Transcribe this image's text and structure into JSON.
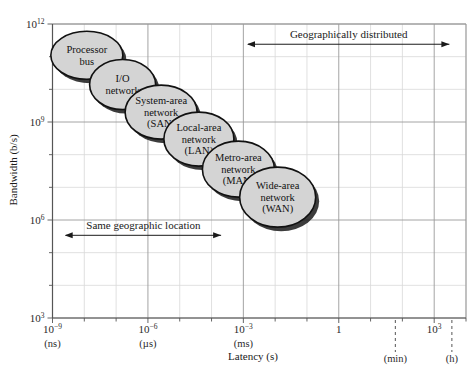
{
  "chart_data": {
    "type": "scatter",
    "title": "",
    "xlabel": "Latency (s)",
    "ylabel": "Bandwidth (b/s)",
    "xscale": "log",
    "yscale": "log",
    "xlim": [
      1e-09,
      10000.0
    ],
    "ylim": [
      1000,
      1000000000000.0
    ],
    "grid": true,
    "legend": "none",
    "x_ticks": [
      {
        "value": 1e-09,
        "mantissa": "10",
        "exponent": "−9",
        "unit": "(ns)"
      },
      {
        "value": 1e-06,
        "mantissa": "10",
        "exponent": "−6",
        "unit": "(µs)"
      },
      {
        "value": 0.001,
        "mantissa": "10",
        "exponent": "−3",
        "unit": "(ms)"
      },
      {
        "value": 1,
        "mantissa": "1",
        "exponent": "",
        "unit": ""
      },
      {
        "value": 1000,
        "mantissa": "10",
        "exponent": "3",
        "unit": ""
      }
    ],
    "x_marker_ticks": [
      {
        "label": "(min)",
        "value": 60
      },
      {
        "label": "(h)",
        "value": 3600
      }
    ],
    "y_ticks": [
      {
        "value": 1000000000000.0,
        "mantissa": "10",
        "exponent": "12"
      },
      {
        "value": 1000000000.0,
        "mantissa": "10",
        "exponent": "9"
      },
      {
        "value": 1000000.0,
        "mantissa": "10",
        "exponent": "6"
      },
      {
        "value": 1000,
        "mantissa": "10",
        "exponent": "3"
      }
    ],
    "points": [
      {
        "name": "Processor bus",
        "lines": [
          "Processor",
          "bus"
        ],
        "x": 1.2e-08,
        "y": 110000000000.0
      },
      {
        "name": "I/O network",
        "lines": [
          "I/O",
          "network"
        ],
        "x": 1.6e-07,
        "y": 14000000000.0
      },
      {
        "name": "System-area network (SAN)",
        "lines": [
          "System-area",
          "network",
          "(SAN)"
        ],
        "x": 2.6e-06,
        "y": 2000000000.0
      },
      {
        "name": "Local-area network (LAN)",
        "lines": [
          "Local-area",
          "network",
          "(LAN)"
        ],
        "x": 4e-05,
        "y": 300000000.0
      },
      {
        "name": "Metro-area network (MAN)",
        "lines": [
          "Metro-area",
          "network",
          "(MAN)"
        ],
        "x": 0.0007,
        "y": 36000000.0
      },
      {
        "name": "Wide-area network (WAN)",
        "lines": [
          "Wide-area",
          "network",
          "(WAN)"
        ],
        "x": 0.012,
        "y": 5000000.0
      }
    ],
    "annotations": [
      {
        "id": "geographically-distributed",
        "text": "Geographically distributed",
        "x_start": 0.0014,
        "x_end": 3000.0,
        "y": 240000000000.0
      },
      {
        "id": "same-geographic-location",
        "text": "Same geographic location",
        "x_start": 2.6e-09,
        "x_end": 0.0002,
        "y": 340000.0
      }
    ]
  },
  "style": {
    "ellipse_fill": "#d4d4d4",
    "ellipse_stroke": "#111111",
    "shadow": "#1a1a1a",
    "grid_major": "#9a9a9a",
    "grid_minor": "#d8d8d8",
    "axis": "#555555",
    "background": "#ffffff"
  }
}
